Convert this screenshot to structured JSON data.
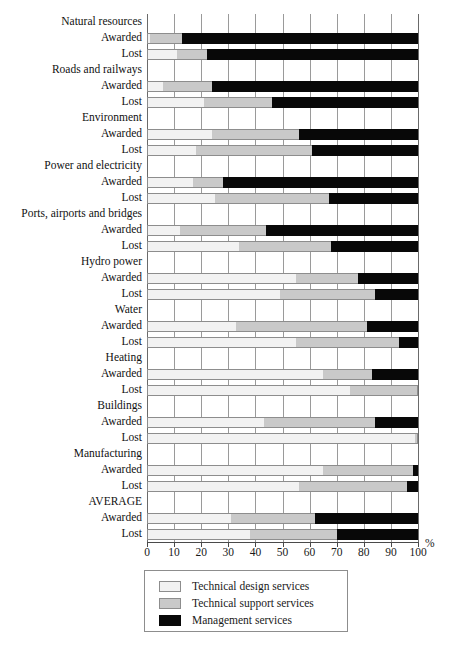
{
  "chart_data": {
    "type": "bar",
    "orientation": "horizontal",
    "stacked": true,
    "stack_mode": "percent",
    "title": "",
    "xlabel": "%",
    "ylabel": "",
    "xlim": [
      0,
      100
    ],
    "xticks": [
      0,
      10,
      20,
      30,
      40,
      50,
      60,
      70,
      80,
      90,
      100
    ],
    "xticklabels": [
      "0",
      "10",
      "20",
      "30",
      "40",
      "50",
      "60",
      "70",
      "80",
      "90",
      "100"
    ],
    "grid": true,
    "legend_position": "bottom",
    "legend": [
      "Technical design services",
      "Technical support services",
      "Management services"
    ],
    "series": [
      {
        "name": "Technical design services",
        "color": "#f2f2f2"
      },
      {
        "name": "Technical support services",
        "color": "#c9c9c9"
      },
      {
        "name": "Management services",
        "color": "#080808"
      }
    ],
    "groups": [
      {
        "label": "Natural resources",
        "rows": [
          {
            "label": "Awarded",
            "values": [
              1,
              12,
              87
            ]
          },
          {
            "label": "Lost",
            "values": [
              11,
              11,
              78
            ]
          }
        ]
      },
      {
        "label": "Roads and railways",
        "rows": [
          {
            "label": "Awarded",
            "values": [
              6,
              18,
              76
            ]
          },
          {
            "label": "Lost",
            "values": [
              21,
              25,
              54
            ]
          }
        ]
      },
      {
        "label": "Environment",
        "rows": [
          {
            "label": "Awarded",
            "values": [
              24,
              32,
              44
            ]
          },
          {
            "label": "Lost",
            "values": [
              18,
              43,
              39
            ]
          }
        ]
      },
      {
        "label": "Power and electricity",
        "rows": [
          {
            "label": "Awarded",
            "values": [
              17,
              11,
              72
            ]
          },
          {
            "label": "Lost",
            "values": [
              25,
              42,
              33
            ]
          }
        ]
      },
      {
        "label": "Ports, airports and bridges",
        "rows": [
          {
            "label": "Awarded",
            "values": [
              12,
              32,
              56
            ]
          },
          {
            "label": "Lost",
            "values": [
              34,
              34,
              32
            ]
          }
        ]
      },
      {
        "label": "Hydro power",
        "rows": [
          {
            "label": "Awarded",
            "values": [
              55,
              23,
              22
            ]
          },
          {
            "label": "Lost",
            "values": [
              49,
              35,
              16
            ]
          }
        ]
      },
      {
        "label": "Water",
        "rows": [
          {
            "label": "Awarded",
            "values": [
              33,
              48,
              19
            ]
          },
          {
            "label": "Lost",
            "values": [
              55,
              38,
              7
            ]
          }
        ]
      },
      {
        "label": "Heating",
        "rows": [
          {
            "label": "Awarded",
            "values": [
              65,
              18,
              17
            ]
          },
          {
            "label": "Lost",
            "values": [
              75,
              25,
              0
            ]
          }
        ]
      },
      {
        "label": "Buildings",
        "rows": [
          {
            "label": "Awarded",
            "values": [
              43,
              41,
              16
            ]
          },
          {
            "label": "Lost",
            "values": [
              99,
              1,
              0
            ]
          }
        ]
      },
      {
        "label": "Manufacturing",
        "rows": [
          {
            "label": "Awarded",
            "values": [
              65,
              33,
              2
            ]
          },
          {
            "label": "Lost",
            "values": [
              56,
              40,
              4
            ]
          }
        ]
      },
      {
        "label": "AVERAGE",
        "rows": [
          {
            "label": "Awarded",
            "values": [
              31,
              31,
              38
            ]
          },
          {
            "label": "Lost",
            "values": [
              38,
              32,
              30
            ]
          }
        ]
      }
    ]
  }
}
